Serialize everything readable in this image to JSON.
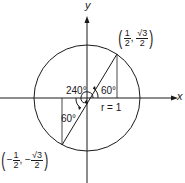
{
  "diagram": {
    "axes": {
      "x_label": "x",
      "y_label": "y"
    },
    "circle": {
      "radius_label": "r = 1"
    },
    "angles": {
      "main": "240°",
      "reference_upper": "60°",
      "reference_lower": "60°"
    },
    "points": {
      "upper": {
        "x_num": "1",
        "x_den": "2",
        "x_sign": "",
        "y_num": "√3",
        "y_den": "2",
        "y_sign": ""
      },
      "lower": {
        "x_num": "1",
        "x_den": "2",
        "x_sign": "−",
        "y_num": "√3",
        "y_den": "2",
        "y_sign": "−"
      }
    },
    "colors": {
      "stroke": "#1a1a1a",
      "background": "#ffffff"
    }
  }
}
